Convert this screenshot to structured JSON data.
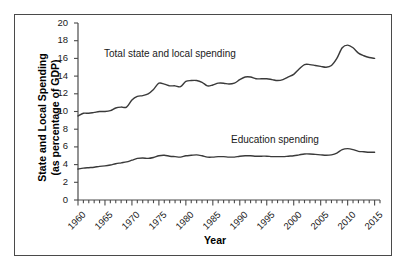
{
  "chart_data": {
    "type": "line",
    "title": "",
    "xlabel": "Year",
    "ylabel": "State and Local Spending\n(as percentage of GDP)",
    "ylabel_line1": "State and Local Spending",
    "ylabel_line2": "(as percentage of GDP)",
    "xlim": [
      1960,
      2016
    ],
    "ylim": [
      0,
      20
    ],
    "ytick_step": 2,
    "xtick_step": 5,
    "grid": false,
    "legend_position": "inline-annotation",
    "yticks": [
      "20",
      "18",
      "16",
      "14",
      "12",
      "10",
      "8",
      "6",
      "4",
      "2",
      "0"
    ],
    "xticks": [
      "1960",
      "1965",
      "1970",
      "1975",
      "1980",
      "1985",
      "1990",
      "1995",
      "2000",
      "2005",
      "2010",
      "2015"
    ],
    "line_color": "#3a3a3a",
    "frame_color": "#4a4a4a",
    "x": [
      1960,
      1961,
      1962,
      1963,
      1964,
      1965,
      1966,
      1967,
      1968,
      1969,
      1970,
      1971,
      1972,
      1973,
      1974,
      1975,
      1976,
      1977,
      1978,
      1979,
      1980,
      1981,
      1982,
      1983,
      1984,
      1985,
      1986,
      1987,
      1988,
      1989,
      1990,
      1991,
      1992,
      1993,
      1994,
      1995,
      1996,
      1997,
      1998,
      1999,
      2000,
      2001,
      2002,
      2003,
      2004,
      2005,
      2006,
      2007,
      2008,
      2009,
      2010,
      2011,
      2012,
      2013,
      2014,
      2015
    ],
    "series": [
      {
        "name": "Total state and local spending",
        "label": "Total state and local spending",
        "values": [
          9.5,
          9.8,
          9.8,
          9.9,
          10.0,
          10.0,
          10.1,
          10.4,
          10.5,
          10.5,
          11.3,
          11.7,
          11.8,
          12.0,
          12.5,
          13.2,
          13.1,
          12.9,
          12.9,
          12.8,
          13.4,
          13.5,
          13.5,
          13.3,
          12.9,
          13.0,
          13.2,
          13.2,
          13.1,
          13.2,
          13.6,
          13.9,
          13.9,
          13.7,
          13.7,
          13.7,
          13.6,
          13.5,
          13.6,
          13.9,
          14.2,
          14.8,
          15.3,
          15.3,
          15.2,
          15.1,
          15.0,
          15.2,
          16.0,
          17.2,
          17.5,
          17.2,
          16.6,
          16.3,
          16.1,
          16.0
        ]
      },
      {
        "name": "Education spending",
        "label": "Education spending",
        "values": [
          3.5,
          3.6,
          3.65,
          3.7,
          3.8,
          3.85,
          3.95,
          4.1,
          4.2,
          4.3,
          4.5,
          4.7,
          4.75,
          4.7,
          4.8,
          5.0,
          5.05,
          4.95,
          4.9,
          4.85,
          5.0,
          5.05,
          5.1,
          5.0,
          4.85,
          4.85,
          4.9,
          4.9,
          4.85,
          4.85,
          4.95,
          5.0,
          5.0,
          4.95,
          4.95,
          4.95,
          4.9,
          4.9,
          4.9,
          4.95,
          5.0,
          5.1,
          5.2,
          5.2,
          5.15,
          5.1,
          5.05,
          5.1,
          5.3,
          5.7,
          5.8,
          5.7,
          5.5,
          5.45,
          5.4,
          5.4
        ]
      }
    ]
  }
}
